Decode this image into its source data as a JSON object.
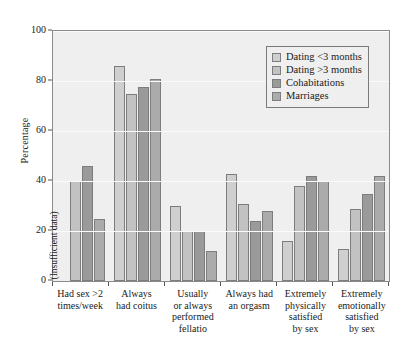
{
  "chart_data": {
    "type": "bar",
    "title": "",
    "xlabel": "",
    "ylabel": "Percentage",
    "ylim": [
      0,
      100
    ],
    "yticks": [
      0,
      20,
      40,
      60,
      80,
      100
    ],
    "grid": true,
    "legend_position": "top-right",
    "missing_note": "(Insufficient data)",
    "categories": [
      [
        "Had sex >2",
        "times/week"
      ],
      [
        "Always",
        "had coitus"
      ],
      [
        "Usually",
        "or always",
        "performed",
        "fellatio"
      ],
      [
        "Always had",
        "an orgasm"
      ],
      [
        "Extremely",
        "physically",
        "satisfied",
        "by sex"
      ],
      [
        "Extremely",
        "emotionally",
        "satisfied",
        "by sex"
      ]
    ],
    "series": [
      {
        "name": "Dating <3 months",
        "color": "#cfcfcf",
        "values": [
          null,
          86,
          30,
          43,
          16,
          13
        ]
      },
      {
        "name": "Dating >3 months",
        "color": "#c2c2c2",
        "values": [
          40,
          75,
          20,
          31,
          38,
          29
        ]
      },
      {
        "name": "Cohabitations",
        "color": "#9a9a9a",
        "values": [
          46,
          77.5,
          20,
          24,
          42,
          35
        ]
      },
      {
        "name": "Marriages",
        "color": "#ababab",
        "values": [
          25,
          81,
          12,
          28,
          40,
          42
        ]
      }
    ]
  }
}
